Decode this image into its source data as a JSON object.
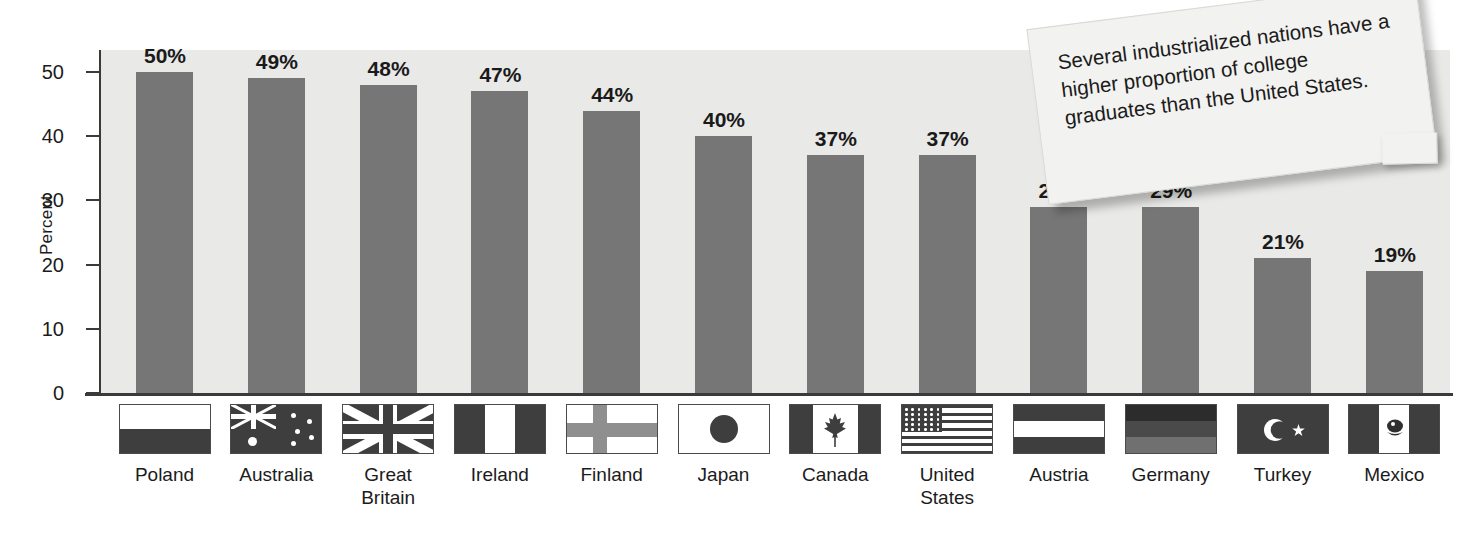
{
  "chart_data": {
    "type": "bar",
    "title": "",
    "xlabel": "",
    "ylabel": "Percent",
    "ylim": [
      0,
      50
    ],
    "yticks": [
      0,
      10,
      20,
      30,
      40,
      50
    ],
    "grid": false,
    "legend": "none",
    "categories": [
      "Poland",
      "Australia",
      "Great\nBritain",
      "Ireland",
      "Finland",
      "Japan",
      "Canada",
      "United\nStates",
      "Austria",
      "Germany",
      "Turkey",
      "Mexico"
    ],
    "values": [
      50,
      49,
      48,
      47,
      44,
      40,
      37,
      37,
      29,
      29,
      21,
      19
    ],
    "data_labels": [
      "50%",
      "49%",
      "48%",
      "47%",
      "44%",
      "40%",
      "37%",
      "37%",
      "29%",
      "29%",
      "21%",
      "19%"
    ],
    "bar_color": "#767676",
    "plot_background": "#e9e9e7",
    "annotations": [
      "Several industrialized nations have a higher proportion of college graduates than the United States."
    ]
  },
  "axis": {
    "y_title": "Percent",
    "y_tick_labels": [
      "50",
      "40",
      "30",
      "20",
      "10",
      "0"
    ]
  },
  "callout": {
    "text": "Several industrialized nations have a higher proportion of college graduates than the United States."
  },
  "flags": [
    {
      "country": "Poland",
      "icon": "flag-poland-icon"
    },
    {
      "country": "Australia",
      "icon": "flag-australia-icon"
    },
    {
      "country": "Great Britain",
      "icon": "flag-great-britain-icon"
    },
    {
      "country": "Ireland",
      "icon": "flag-ireland-icon"
    },
    {
      "country": "Finland",
      "icon": "flag-finland-icon"
    },
    {
      "country": "Japan",
      "icon": "flag-japan-icon"
    },
    {
      "country": "Canada",
      "icon": "flag-canada-icon"
    },
    {
      "country": "United States",
      "icon": "flag-united-states-icon"
    },
    {
      "country": "Austria",
      "icon": "flag-austria-icon"
    },
    {
      "country": "Germany",
      "icon": "flag-germany-icon"
    },
    {
      "country": "Turkey",
      "icon": "flag-turkey-icon"
    },
    {
      "country": "Mexico",
      "icon": "flag-mexico-icon"
    }
  ]
}
